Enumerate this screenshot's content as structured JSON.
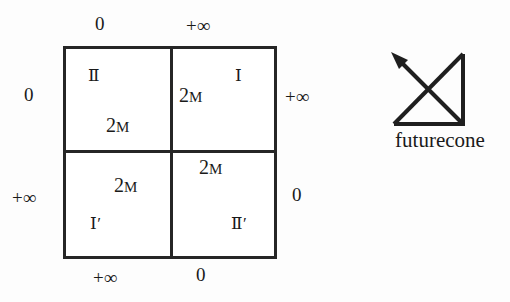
{
  "figure": {
    "type": "spacetime-block-diagram",
    "background_color": "#fdfdfd",
    "line_color": "#262626"
  },
  "diagram": {
    "quadrants": [
      {
        "position": "top-left",
        "region_label": "Ⅱ",
        "mass_label_prefix": "2",
        "mass_label_suffix": "M"
      },
      {
        "position": "top-right",
        "region_label": "Ⅰ",
        "mass_label_prefix": "2",
        "mass_label_suffix": "M"
      },
      {
        "position": "bottom-left",
        "region_label": "Ⅰ′",
        "mass_label_prefix": "2",
        "mass_label_suffix": "M"
      },
      {
        "position": "bottom-right",
        "region_label": "Ⅱ′",
        "mass_label_prefix": "2",
        "mass_label_suffix": "M"
      }
    ],
    "edge_labels": {
      "top_left": "0",
      "top_right": "+∞",
      "bottom_left": "+∞",
      "bottom_right": "0",
      "left_top": "0",
      "left_bottom": "+∞",
      "right_top": "+∞",
      "right_bottom": "0"
    }
  },
  "legend": {
    "caption": "futurecone",
    "glyph_name": "future-light-cone-arrow"
  }
}
